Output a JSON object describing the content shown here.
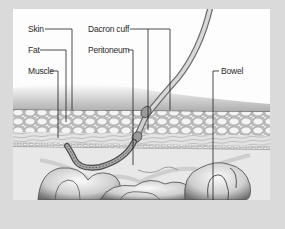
{
  "diagram": {
    "labels": {
      "skin": "Skin",
      "fat": "Fat",
      "muscle": "Muscle",
      "dacron_cuff": "Dacron cuff",
      "peritoneum": "Peritoneum",
      "bowel": "Bowel"
    },
    "colors": {
      "frame": "#dadada",
      "panel": "#fdfdfd",
      "ink": "#2a2a2a",
      "leader": "#1e1e1e"
    }
  }
}
